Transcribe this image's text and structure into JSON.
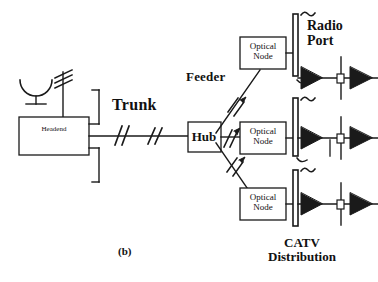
{
  "figure": {
    "caption": "(b)",
    "type": "hfc-catv-network-diagram"
  },
  "labels": {
    "trunk": "Trunk",
    "feeder": "Feeder",
    "radio_port_line1": "Radio",
    "radio_port_line2": "Port",
    "catv_line1": "CATV",
    "catv_line2": "Distribution"
  },
  "nodes": {
    "headend": "Headend",
    "hub": "Hub",
    "optical_node_line1": "Optical",
    "optical_node_line2": "Node"
  },
  "optical_nodes": [
    {
      "line1": "Optical",
      "line2": "Node"
    },
    {
      "line1": "Optical",
      "line2": "Node"
    },
    {
      "line1": "Optical",
      "line2": "Node"
    }
  ],
  "icons": {
    "satellite_dish": "satellite-dish-icon",
    "yagi_antenna": "yagi-antenna-icon",
    "trunk_break": "cable-break-slash-icon",
    "fiber_arrow": "fiber-link-arrow-icon",
    "amplifier": "amplifier-triangle-icon",
    "tap": "tap-splitter-icon",
    "radio_wave": "radio-wave-tilde-icon",
    "mast": "radio-port-mast-icon"
  },
  "colors": {
    "background": "#ffffff",
    "stroke": "#1a1a1a",
    "text": "#111111",
    "fill_solid": "#1a1a1a",
    "fill_hollow": "#ffffff"
  }
}
